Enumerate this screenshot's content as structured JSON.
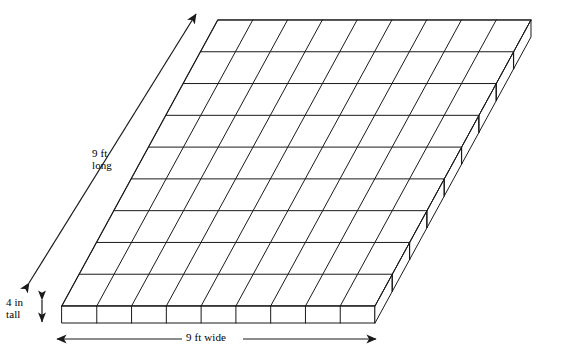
{
  "figure": {
    "type": "isometric-3d-grid-slab",
    "grid": {
      "columns": 9,
      "rows": 9,
      "layers": 1
    },
    "stroke_color": "#1a1a1a",
    "fill_color": "#ffffff",
    "background_color": "#ffffff",
    "line_width": 1.0
  },
  "labels": {
    "long": {
      "line1": "9 ft",
      "line2": "long",
      "text": "9 ft long",
      "value": 9,
      "unit": "ft",
      "dimension": "length"
    },
    "tall": {
      "line1": "4 in",
      "line2": "tall",
      "text": "4 in tall",
      "value": 4,
      "unit": "in",
      "dimension": "height"
    },
    "wide": {
      "text": "9 ft wide",
      "value": 9,
      "unit": "ft",
      "dimension": "width"
    }
  },
  "arrows": {
    "long": {
      "name": "depth-dimension-arrow",
      "style": "double-headed",
      "orientation": "diagonal"
    },
    "tall": {
      "name": "height-dimension-arrow",
      "style": "double-headed",
      "orientation": "vertical"
    },
    "wide": {
      "name": "width-dimension-arrow",
      "style": "double-headed",
      "orientation": "horizontal"
    }
  },
  "geometry": {
    "front_left_x": 62,
    "front_top_y": 306,
    "front_bottom_y": 323,
    "cell_width": 34.78,
    "depth_dx": 17.33,
    "depth_dy": -31.78,
    "slab_thickness": 17
  }
}
